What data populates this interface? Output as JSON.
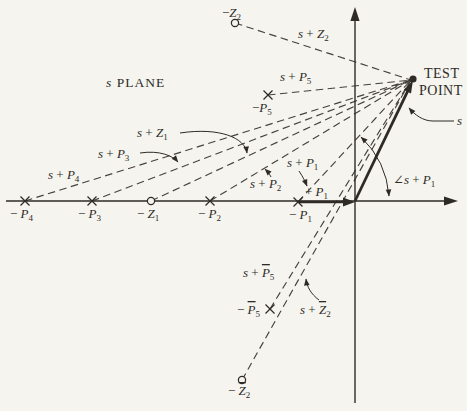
{
  "figure": {
    "width": 467,
    "height": 411,
    "bg": "#f5f4ef",
    "ink": "#2e2b27",
    "dash_color": "#45423c"
  },
  "test_point": {
    "x": 413,
    "y": 79
  },
  "axes": {
    "real": {
      "x1": 6,
      "y1": 201,
      "x2": 458,
      "y2": 201
    },
    "imag": {
      "x1": 355,
      "y1": 403,
      "x2": 355,
      "y2": 7
    }
  },
  "markers": [
    {
      "id": "neg-p4",
      "kind": "pole",
      "x": 25,
      "y": 201
    },
    {
      "id": "neg-p3",
      "kind": "pole",
      "x": 92,
      "y": 201
    },
    {
      "id": "neg-z1",
      "kind": "zero",
      "x": 151,
      "y": 201
    },
    {
      "id": "neg-p2",
      "kind": "pole",
      "x": 210,
      "y": 201
    },
    {
      "id": "neg-p1",
      "kind": "pole",
      "x": 298,
      "y": 202
    },
    {
      "id": "neg-p5",
      "kind": "pole",
      "x": 268,
      "y": 95
    },
    {
      "id": "neg-z2",
      "kind": "zero",
      "x": 235,
      "y": 23
    },
    {
      "id": "neg-p5-conj",
      "kind": "pole",
      "x": 270,
      "y": 309
    },
    {
      "id": "neg-z2-conj",
      "kind": "zero",
      "x": 242,
      "y": 380
    }
  ],
  "vectors": [
    {
      "id": "s-vector",
      "x1": 355,
      "y1": 201,
      "x2": 413,
      "y2": 80,
      "w": 2.8,
      "hl": 13,
      "hw": 4
    },
    {
      "id": "p1-vector",
      "x1": 299,
      "y1": 202,
      "x2": 355,
      "y2": 202,
      "w": 2.4,
      "hl": 12,
      "hw": 4.5
    }
  ],
  "angle_arc": {
    "d": "M 361 137 A 91 91 0 0 1 389 196"
  },
  "leaders": [
    {
      "id": "leader-s-plus-z1",
      "d": "M 180 133 C 220 127 245 138 247 153"
    },
    {
      "id": "leader-s-plus-p3",
      "d": "M 140 153 C 160 150 173 156 178 162"
    },
    {
      "id": "leader-s-plus-p1",
      "d": "M 299 171 C 303 177 305 181 307 186"
    },
    {
      "id": "leader-s-plus-p2",
      "d": "M 271 177 C 269 173 267 171 265 169"
    },
    {
      "id": "leader-s-label",
      "d": "M 454 121 L 433 121 C 423 121 415 115 409 108"
    },
    {
      "id": "leader-s-plus-z2-conj",
      "d": "M 319 300 C 311 294 307 287 306 279"
    }
  ],
  "labels": [
    {
      "id": "s-plane",
      "x": 106,
      "y": 87,
      "fs": 13.5,
      "ls": 1,
      "parts": [
        {
          "t": "s",
          "i": 1
        },
        {
          "t": " PLANE"
        }
      ]
    },
    {
      "id": "test-point-line1",
      "x": 424,
      "y": 78,
      "fs": 14,
      "ls": 0.5,
      "parts": [
        {
          "t": "TEST"
        }
      ]
    },
    {
      "id": "test-point-line2",
      "x": 419,
      "y": 95,
      "fs": 14,
      "ls": 0.5,
      "parts": [
        {
          "t": "POINT"
        }
      ]
    },
    {
      "id": "neg-z2",
      "x": 222,
      "y": 17,
      "parts": [
        {
          "t": "−"
        },
        {
          "t": "Z",
          "i": 1
        },
        {
          "t": "2",
          "sub": 1
        }
      ]
    },
    {
      "id": "s-plus-z2",
      "x": 298,
      "y": 38,
      "parts": [
        {
          "t": "s",
          "i": 1
        },
        {
          "t": " + "
        },
        {
          "t": "Z",
          "i": 1
        },
        {
          "t": "2",
          "sub": 1
        }
      ]
    },
    {
      "id": "s-plus-p5",
      "x": 280,
      "y": 81,
      "parts": [
        {
          "t": "s",
          "i": 1
        },
        {
          "t": " + "
        },
        {
          "t": "P",
          "i": 1
        },
        {
          "t": "5",
          "sub": 1
        }
      ]
    },
    {
      "id": "neg-p5",
      "x": 252,
      "y": 112,
      "parts": [
        {
          "t": "−"
        },
        {
          "t": "P",
          "i": 1
        },
        {
          "t": "5",
          "sub": 1
        }
      ]
    },
    {
      "id": "s-label",
      "x": 457,
      "y": 125,
      "parts": [
        {
          "t": "s",
          "i": 1
        }
      ]
    },
    {
      "id": "s-plus-z1",
      "x": 137,
      "y": 137,
      "parts": [
        {
          "t": "s",
          "i": 1
        },
        {
          "t": " + "
        },
        {
          "t": "Z",
          "i": 1
        },
        {
          "t": "1",
          "sub": 1
        }
      ]
    },
    {
      "id": "s-plus-p3",
      "x": 98,
      "y": 158,
      "parts": [
        {
          "t": "s",
          "i": 1
        },
        {
          "t": " + "
        },
        {
          "t": "P",
          "i": 1
        },
        {
          "t": "3",
          "sub": 1
        }
      ]
    },
    {
      "id": "s-plus-p4",
      "x": 48,
      "y": 179,
      "parts": [
        {
          "t": "s",
          "i": 1
        },
        {
          "t": " + "
        },
        {
          "t": "P",
          "i": 1
        },
        {
          "t": "4",
          "sub": 1
        }
      ]
    },
    {
      "id": "s-plus-p1",
      "x": 287,
      "y": 167,
      "parts": [
        {
          "t": "s",
          "i": 1
        },
        {
          "t": " + "
        },
        {
          "t": "P",
          "i": 1
        },
        {
          "t": "1",
          "sub": 1
        }
      ]
    },
    {
      "id": "s-plus-p2",
      "x": 250,
      "y": 188,
      "parts": [
        {
          "t": "s",
          "i": 1
        },
        {
          "t": " + "
        },
        {
          "t": "P",
          "i": 1
        },
        {
          "t": "2",
          "sub": 1
        }
      ]
    },
    {
      "id": "plus-p1",
      "x": 305,
      "y": 196,
      "parts": [
        {
          "t": "+ "
        },
        {
          "t": "P",
          "i": 1
        },
        {
          "t": "1",
          "sub": 1
        }
      ]
    },
    {
      "id": "angle-s-plus-p1",
      "x": 393,
      "y": 184,
      "parts": [
        {
          "t": "∠"
        },
        {
          "t": "s",
          "i": 1
        },
        {
          "t": " + "
        },
        {
          "t": "P",
          "i": 1
        },
        {
          "t": "1",
          "sub": 1
        }
      ]
    },
    {
      "id": "neg-p4-label",
      "x": 10,
      "y": 218,
      "parts": [
        {
          "t": "− "
        },
        {
          "t": "P",
          "i": 1
        },
        {
          "t": "4",
          "sub": 1
        }
      ]
    },
    {
      "id": "neg-p3-label",
      "x": 78,
      "y": 218,
      "parts": [
        {
          "t": "− "
        },
        {
          "t": "P",
          "i": 1
        },
        {
          "t": "3",
          "sub": 1
        }
      ]
    },
    {
      "id": "neg-z1-label",
      "x": 137,
      "y": 218,
      "parts": [
        {
          "t": "− "
        },
        {
          "t": "Z",
          "i": 1
        },
        {
          "t": "1",
          "sub": 1
        }
      ]
    },
    {
      "id": "neg-p2-label",
      "x": 198,
      "y": 218,
      "parts": [
        {
          "t": "− "
        },
        {
          "t": "P",
          "i": 1
        },
        {
          "t": "2",
          "sub": 1
        }
      ]
    },
    {
      "id": "neg-p1-label",
      "x": 289,
      "y": 219,
      "parts": [
        {
          "t": "− "
        },
        {
          "t": "P",
          "i": 1
        },
        {
          "t": "1",
          "sub": 1
        }
      ]
    },
    {
      "id": "s-plus-p5-conj",
      "x": 243,
      "y": 277,
      "parts": [
        {
          "t": "s",
          "i": 1
        },
        {
          "t": " + "
        },
        {
          "t": "P",
          "i": 1,
          "bar": 1
        },
        {
          "t": "5",
          "sub": 1
        }
      ]
    },
    {
      "id": "neg-p5-conj-label",
      "x": 237,
      "y": 314,
      "parts": [
        {
          "t": "− "
        },
        {
          "t": "P",
          "i": 1,
          "bar": 1
        },
        {
          "t": "5",
          "sub": 1
        }
      ]
    },
    {
      "id": "s-plus-z2-conj",
      "x": 300,
      "y": 314,
      "parts": [
        {
          "t": "s",
          "i": 1
        },
        {
          "t": " + "
        },
        {
          "t": "Z",
          "i": 1,
          "bar": 1
        },
        {
          "t": "2",
          "sub": 1
        }
      ]
    },
    {
      "id": "neg-z2-conj-label",
      "x": 228,
      "y": 395,
      "parts": [
        {
          "t": "− "
        },
        {
          "t": "Z",
          "i": 1,
          "bar": 1
        },
        {
          "t": "2",
          "sub": 1
        }
      ]
    }
  ]
}
